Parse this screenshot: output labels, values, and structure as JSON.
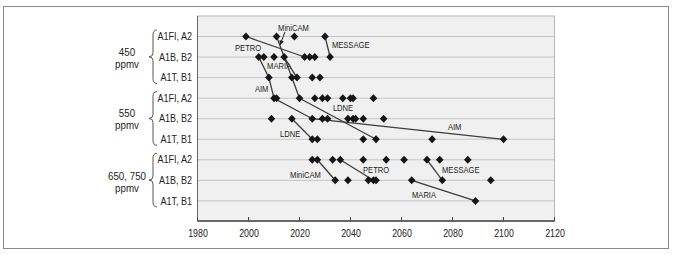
{
  "chart_data": {
    "type": "scatter",
    "title": "",
    "xlabel": "",
    "ylabel": "",
    "xlim": [
      1980,
      2120
    ],
    "xticks": [
      1980,
      2000,
      2020,
      2040,
      2060,
      2080,
      2100,
      2120
    ],
    "grid": {
      "horizontal": true,
      "vertical": false
    },
    "legend": null,
    "marker": "diamond",
    "colors": {
      "marker": "#151515",
      "line": "#3c3c3c",
      "grid": "#c4c4c4",
      "plot_bg": "#f0f0f0",
      "axis": "#444444",
      "text": "#222222"
    },
    "groups": [
      {
        "label": "450",
        "unit": "ppmv",
        "rows": [
          "A1FI, A2",
          "A1B, B2",
          "A1T, B1"
        ]
      },
      {
        "label": "550",
        "unit": "ppmv",
        "rows": [
          "A1FI, A2",
          "A1B, B2",
          "A1T, B1"
        ]
      },
      {
        "label": "650, 750",
        "unit": "ppmv",
        "rows": [
          "A1FI, A2",
          "A1B, B2",
          "A1T, B1"
        ]
      }
    ],
    "rows": [
      {
        "group": "450 ppmv",
        "scenario": "A1FI, A2",
        "years": [
          1999,
          2011,
          2018,
          2030
        ]
      },
      {
        "group": "450 ppmv",
        "scenario": "A1B, B2",
        "years": [
          2004,
          2006,
          2010,
          2014,
          2022,
          2024,
          2026,
          2032
        ]
      },
      {
        "group": "450 ppmv",
        "scenario": "A1T, B1",
        "years": [
          2008,
          2017,
          2019,
          2025,
          2028
        ]
      },
      {
        "group": "550 ppmv",
        "scenario": "A1FI, A2",
        "years": [
          2010,
          2011,
          2020,
          2026,
          2029,
          2031,
          2037,
          2040,
          2041,
          2049
        ]
      },
      {
        "group": "550 ppmv",
        "scenario": "A1B, B2",
        "years": [
          2009,
          2017,
          2025,
          2029,
          2031,
          2039,
          2041,
          2042,
          2045,
          2053
        ]
      },
      {
        "group": "550 ppmv",
        "scenario": "A1T, B1",
        "years": [
          2025,
          2027,
          2045,
          2050,
          2072,
          2100
        ]
      },
      {
        "group": "650, 750 ppmv",
        "scenario": "A1FI, A2",
        "years": [
          2025,
          2027,
          2033,
          2036,
          2045,
          2054,
          2061,
          2070,
          2075,
          2086
        ]
      },
      {
        "group": "650, 750 ppmv",
        "scenario": "A1B, B2",
        "years": [
          2034,
          2039,
          2047,
          2049,
          2050,
          2064,
          2076,
          2095
        ]
      },
      {
        "group": "650, 750 ppmv",
        "scenario": "A1T, B1",
        "years": [
          2089
        ]
      }
    ],
    "series": [
      {
        "name": "PETRO",
        "points": [
          [
            1999,
            0
          ],
          [
            2022,
            1
          ]
        ]
      },
      {
        "name": "MiniCAM",
        "points": [
          [
            2011,
            0
          ],
          [
            2014,
            1
          ],
          [
            2017,
            2
          ],
          [
            2020,
            3
          ]
        ]
      },
      {
        "name": "MARIA",
        "points": [
          [
            2014,
            1
          ],
          [
            2019,
            2
          ]
        ]
      },
      {
        "name": "MESSAGE",
        "points": [
          [
            2030,
            0
          ],
          [
            2032,
            1
          ]
        ]
      },
      {
        "name": "AIM",
        "points": [
          [
            2004,
            1
          ],
          [
            2008,
            2
          ],
          [
            2010,
            3
          ],
          [
            2025,
            4
          ],
          [
            2100,
            5
          ]
        ]
      },
      {
        "name": "LDNE",
        "points": [
          [
            2020,
            3
          ],
          [
            2050,
            5
          ]
        ]
      },
      {
        "name": "LDNE",
        "points": [
          [
            2017,
            4
          ],
          [
            2025,
            5
          ]
        ]
      },
      {
        "name": "MiniCAM",
        "points": [
          [
            2027,
            6
          ],
          [
            2034,
            7
          ]
        ]
      },
      {
        "name": "PETRO",
        "points": [
          [
            2036,
            6
          ],
          [
            2049,
            7
          ]
        ]
      },
      {
        "name": "MESSAGE",
        "points": [
          [
            2070,
            6
          ],
          [
            2076,
            7
          ]
        ]
      },
      {
        "name": "MARIA",
        "points": [
          [
            2064,
            7
          ],
          [
            2089,
            8
          ]
        ]
      }
    ],
    "annotations": [
      {
        "text": "MiniCAM",
        "x": 2011.6,
        "y": -0.29,
        "arrow": {
          "from": [
            2014.3,
            -0.22
          ],
          "to": [
            2012.4,
            0.41
          ]
        }
      },
      {
        "text": "PETRO",
        "x": 1994.7,
        "y": 0.71
      },
      {
        "text": "MESSAGE",
        "x": 2032.7,
        "y": 0.54
      },
      {
        "text": "MARIA",
        "x": 2007.3,
        "y": 1.56
      },
      {
        "text": "AIM",
        "x": 2002.5,
        "y": 2.68
      },
      {
        "text": "LDNE",
        "x": 2033.1,
        "y": 3.6
      },
      {
        "text": "LDNE",
        "x": 2012.4,
        "y": 4.87
      },
      {
        "text": "AIM",
        "x": 2078.2,
        "y": 4.53
      },
      {
        "text": "MiniCAM",
        "x": 2016.3,
        "y": 6.86
      },
      {
        "text": "PETRO",
        "x": 2044.9,
        "y": 6.62
      },
      {
        "text": "MESSAGE",
        "x": 2075.9,
        "y": 6.62
      },
      {
        "text": "MARIA",
        "x": 2064.1,
        "y": 7.88
      }
    ]
  }
}
